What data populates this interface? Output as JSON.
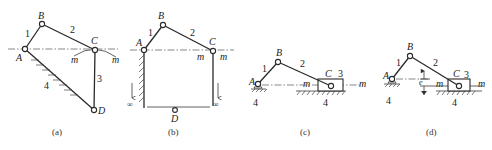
{
  "figure": {
    "panels": [
      {
        "id": "a",
        "caption": "(a)",
        "joints": {
          "A": "A",
          "B": "B",
          "C": "C",
          "D": "D"
        },
        "links": {
          "1": "1",
          "2": "2",
          "3": "3",
          "4": "4"
        },
        "path_labels": [
          "m",
          "m"
        ]
      },
      {
        "id": "b",
        "caption": "(b)",
        "joints": {
          "A": "A",
          "B": "B",
          "C": "C",
          "D": "D"
        },
        "links": {
          "1": "1",
          "2": "2"
        },
        "path_labels": [
          "m",
          "m"
        ],
        "infinity_labels": [
          "∞",
          "∞"
        ]
      },
      {
        "id": "c",
        "caption": "(c)",
        "joints": {
          "A": "A",
          "B": "B",
          "C": "C"
        },
        "links": {
          "1": "1",
          "2": "2",
          "3": "3",
          "4a": "4",
          "4b": "4"
        },
        "path_labels": [
          "m",
          "m"
        ]
      },
      {
        "id": "d",
        "caption": "(d)",
        "joints": {
          "A": "A",
          "B": "B",
          "C": "C"
        },
        "links": {
          "1": "1",
          "2": "2",
          "3": "3",
          "4a": "4",
          "4b": "4"
        },
        "path_labels": [
          "m",
          "m"
        ],
        "offset_label": "e"
      }
    ]
  }
}
